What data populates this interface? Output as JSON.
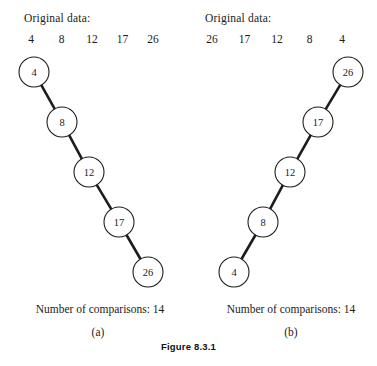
{
  "figure": {
    "caption": "Figure 8.3.1"
  },
  "panels": [
    {
      "id": "a",
      "label": "(a)",
      "heading": "Original data:",
      "data_values": [
        "4",
        "8",
        "12",
        "17",
        "26"
      ],
      "comparisons_text": "Number of comparisons: 14",
      "comparisons_count": 14,
      "nodes": [
        {
          "label": "4",
          "cx": 34,
          "cy": 22,
          "r": 15
        },
        {
          "label": "8",
          "cx": 62,
          "cy": 72,
          "r": 15
        },
        {
          "label": "12",
          "cx": 89,
          "cy": 122,
          "r": 15
        },
        {
          "label": "17",
          "cx": 119,
          "cy": 172,
          "r": 15
        },
        {
          "label": "26",
          "cx": 148,
          "cy": 222,
          "r": 15
        }
      ],
      "edges": [
        {
          "from": "4",
          "to": "8"
        },
        {
          "from": "8",
          "to": "12"
        },
        {
          "from": "12",
          "to": "17"
        },
        {
          "from": "17",
          "to": "26"
        }
      ]
    },
    {
      "id": "b",
      "label": "(b)",
      "heading": "Original data:",
      "data_values": [
        "26",
        "17",
        "12",
        "8",
        "4"
      ],
      "comparisons_text": "Number of comparisons: 14",
      "comparisons_count": 14,
      "nodes": [
        {
          "label": "26",
          "cx": 159,
          "cy": 22,
          "r": 15
        },
        {
          "label": "17",
          "cx": 129,
          "cy": 72,
          "r": 15
        },
        {
          "label": "12",
          "cx": 101,
          "cy": 122,
          "r": 15
        },
        {
          "label": "8",
          "cx": 74,
          "cy": 172,
          "r": 15
        },
        {
          "label": "4",
          "cx": 45,
          "cy": 222,
          "r": 15
        }
      ],
      "edges": [
        {
          "from": "26",
          "to": "17"
        },
        {
          "from": "17",
          "to": "12"
        },
        {
          "from": "12",
          "to": "8"
        },
        {
          "from": "8",
          "to": "4"
        }
      ]
    }
  ],
  "colors": {
    "background": "#ffffff",
    "ink": "#1a1a1a",
    "edge": "#1d1d1d",
    "node_fill": "#ffffff"
  }
}
